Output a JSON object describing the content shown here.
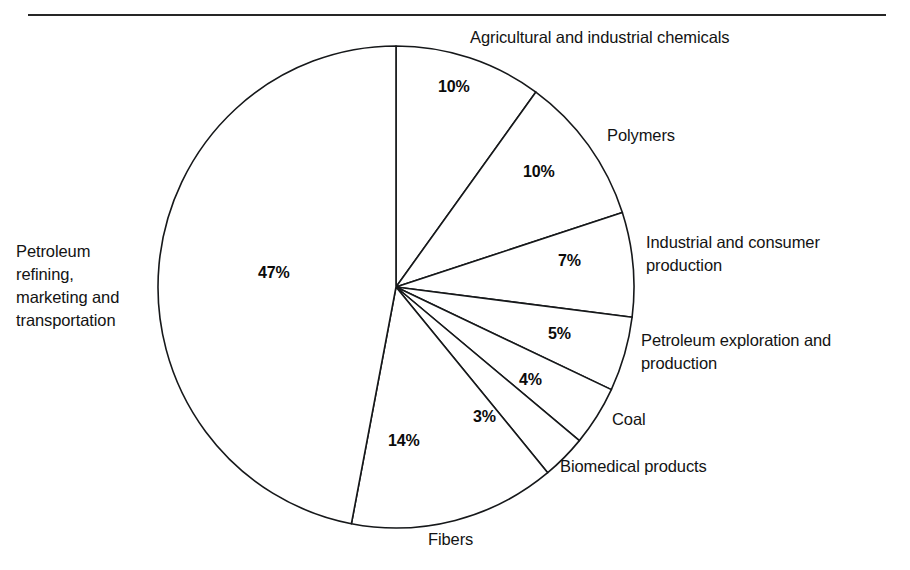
{
  "figure": {
    "has_top_rule": true,
    "background_color": "#ffffff",
    "line_color": "#16181a"
  },
  "chart_data": {
    "type": "pie",
    "title": "",
    "subtitle": "",
    "xlabel": "",
    "ylabel": "",
    "legend_position": "none",
    "grid": false,
    "units": "percent",
    "start_angle_deg": 0,
    "direction": "clockwise",
    "total": 100,
    "categories": [
      "Agricultural and industrial chemicals",
      "Polymers",
      "Industrial and consumer production",
      "Petroleum exploration and production",
      "Coal",
      "Biomedical products",
      "Fibers",
      "Petroleum refining, marketing and transportation"
    ],
    "values": [
      10,
      10,
      7,
      5,
      4,
      3,
      14,
      47
    ],
    "value_labels": [
      "10%",
      "10%",
      "7%",
      "5%",
      "4%",
      "3%",
      "14%",
      "47%"
    ],
    "slices": [
      {
        "label": "Agricultural and industrial chemicals",
        "value": 10,
        "value_label": "10%",
        "start_deg": 0,
        "end_deg": 36
      },
      {
        "label": "Polymers",
        "value": 10,
        "value_label": "10%",
        "start_deg": 36,
        "end_deg": 72
      },
      {
        "label": "Industrial and consumer production",
        "value": 7,
        "value_label": "7%",
        "start_deg": 72,
        "end_deg": 97.2
      },
      {
        "label": "Petroleum exploration and production",
        "value": 5,
        "value_label": "5%",
        "start_deg": 97.2,
        "end_deg": 115.2
      },
      {
        "label": "Coal",
        "value": 4,
        "value_label": "4%",
        "start_deg": 115.2,
        "end_deg": 129.6
      },
      {
        "label": "Biomedical products",
        "value": 3,
        "value_label": "3%",
        "start_deg": 129.6,
        "end_deg": 140.4
      },
      {
        "label": "Fibers",
        "value": 14,
        "value_label": "14%",
        "start_deg": 140.4,
        "end_deg": 190.8
      },
      {
        "label": "Petroleum refining, marketing and transportation",
        "value": 47,
        "value_label": "47%",
        "start_deg": 190.8,
        "end_deg": 360
      }
    ],
    "annotations": {
      "agricultural_label": "Agricultural and industrial chemicals",
      "polymers_label": "Polymers",
      "industrial_line1": "Industrial and consumer",
      "industrial_line2": "production",
      "petroleum_expl_line1": "Petroleum exploration and",
      "petroleum_expl_line2": "production",
      "coal_label": "Coal",
      "biomedical_label": "Biomedical products",
      "fibers_label": "Fibers",
      "refining_line1": "Petroleum",
      "refining_line2": "refining,",
      "refining_line3": "marketing and",
      "refining_line4": "transportation",
      "pct_agricultural": "10%",
      "pct_polymers": "10%",
      "pct_industrial": "7%",
      "pct_petroleum_expl": "5%",
      "pct_coal": "4%",
      "pct_biomedical": "3%",
      "pct_fibers": "14%",
      "pct_refining": "47%"
    }
  }
}
